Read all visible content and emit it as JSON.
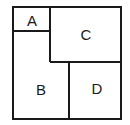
{
  "diagram": {
    "regions": [
      {
        "id": "A",
        "label": "A"
      },
      {
        "id": "B",
        "label": "B"
      },
      {
        "id": "C",
        "label": "C"
      },
      {
        "id": "D",
        "label": "D"
      }
    ]
  }
}
